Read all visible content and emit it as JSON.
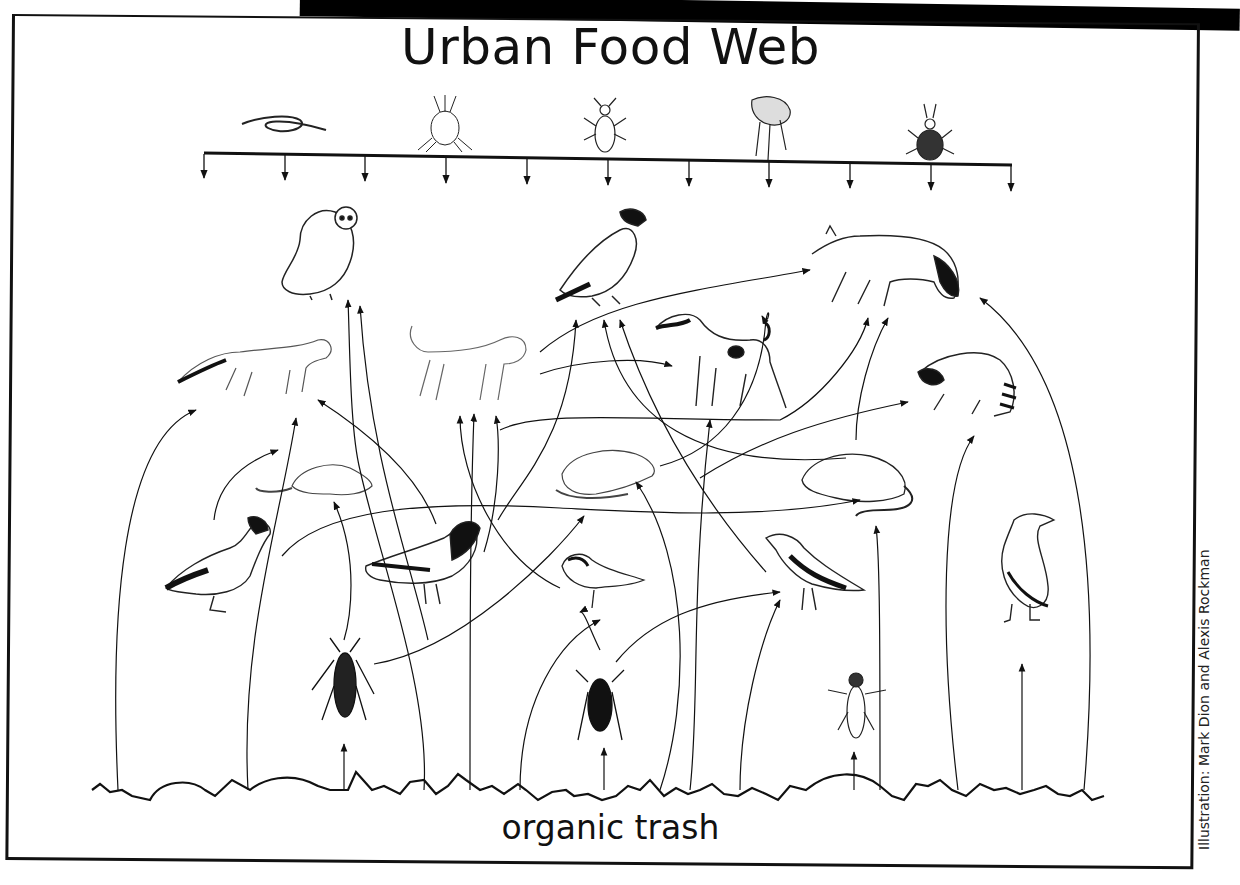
{
  "title": "Urban Food Web",
  "ground_label": "organic trash",
  "credit": "Illustration:  Mark Dion and  Alexis Rockman",
  "parasites": {
    "items": [
      "roundworm",
      "mite",
      "louse",
      "flea",
      "tick"
    ],
    "bar_arrow_count": 11
  },
  "organisms": {
    "top_predators": [
      "owl",
      "peregrine falcon",
      "coyote"
    ],
    "mid_predators": [
      "red fox",
      "cat",
      "dog",
      "raccoon"
    ],
    "rodents": [
      "mouse",
      "rat",
      "rat (brown)"
    ],
    "birds": [
      "mallard duck",
      "pigeon",
      "sparrow",
      "starling",
      "gull"
    ],
    "insects": [
      "cockroach",
      "house fly",
      "fly"
    ]
  }
}
